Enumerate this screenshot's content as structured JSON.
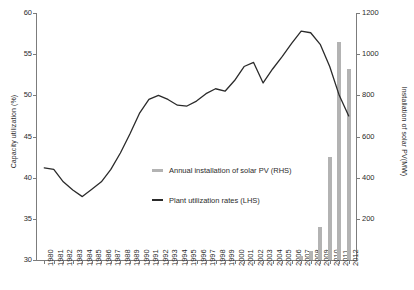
{
  "chart_data": {
    "type": "bar",
    "title": "",
    "subtitle": "",
    "grid": false,
    "legend_position": "center",
    "xlabel": "",
    "ylabel": "Capacity utilization (%)",
    "y2label": "Installation of solar PV(MW)",
    "ylim": [
      30,
      60
    ],
    "y2lim": [
      0,
      1200
    ],
    "ytick_labels": [
      "30",
      "35",
      "40",
      "45",
      "50",
      "55",
      "60"
    ],
    "ytick_values": [
      30,
      35,
      40,
      45,
      50,
      55,
      60
    ],
    "y2tick_labels": [
      "200",
      "400",
      "600",
      "800",
      "1000",
      "1200"
    ],
    "y2tick_values": [
      200,
      400,
      600,
      800,
      1000,
      1200
    ],
    "categories": [
      "1980",
      "1981",
      "1982",
      "1983",
      "1984",
      "1985",
      "1986",
      "1987",
      "1988",
      "1989",
      "1990",
      "1991",
      "1992",
      "1993",
      "1994",
      "1995",
      "1996",
      "1997",
      "1998",
      "1999",
      "2000",
      "2001",
      "2002",
      "2003",
      "2004",
      "2005",
      "2006",
      "2007",
      "2008",
      "2009",
      "2010",
      "2011",
      "2012"
    ],
    "series": [
      {
        "name": "Annual installation of solar PV (RHS)",
        "type": "bar",
        "axis": "right",
        "color": "#b3b3b3",
        "values": [
          0,
          0,
          0,
          0,
          0,
          0,
          0,
          0,
          0,
          0,
          0,
          0,
          0,
          0,
          0,
          0,
          0,
          0,
          0,
          0,
          0,
          0,
          0,
          0,
          0,
          0,
          0,
          20,
          45,
          160,
          500,
          1060,
          930
        ]
      },
      {
        "name": "Plant utilization rates (LHS)",
        "type": "line",
        "axis": "left",
        "color": "#2b2b2b",
        "values": [
          41.2,
          41.0,
          39.5,
          38.5,
          37.7,
          38.6,
          39.5,
          41.0,
          43.0,
          45.3,
          47.8,
          49.5,
          50.0,
          49.5,
          48.8,
          48.7,
          49.3,
          50.2,
          50.8,
          50.5,
          51.8,
          53.5,
          54.0,
          51.5,
          53.2,
          54.7,
          56.3,
          57.8,
          57.6,
          56.2,
          53.5,
          50.0,
          47.5
        ]
      }
    ]
  },
  "legend": {
    "items": [
      {
        "label": "Annual installation of solar PV (RHS)",
        "marker": "bar",
        "color": "#b3b3b3"
      },
      {
        "label": "Plant utilization rates (LHS)",
        "marker": "line",
        "color": "#2b2b2b"
      }
    ]
  }
}
